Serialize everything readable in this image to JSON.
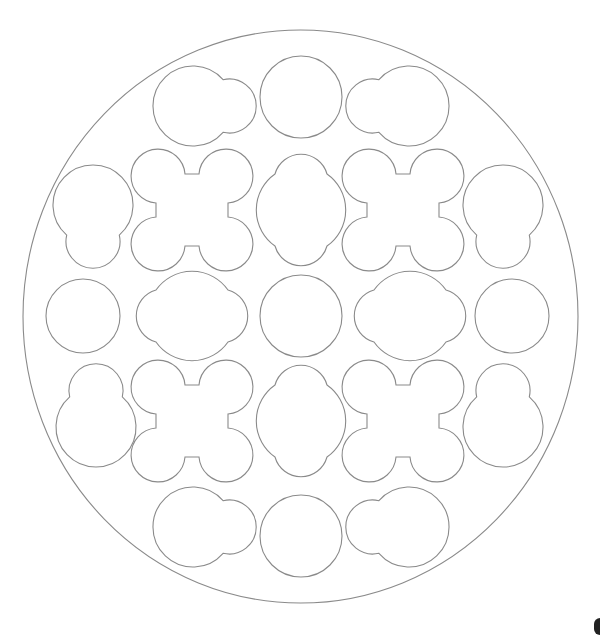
{
  "diagram": {
    "type": "geometric tiling pattern",
    "stroke_color": "#8a8a8a",
    "background": "#ffffff",
    "outer_boundary": {
      "shape": "circle",
      "cx": 300,
      "cy": 316,
      "rx": 277,
      "ry": 286
    },
    "grid": {
      "rows": 5,
      "cols": 5,
      "col_x": [
        83,
        192,
        301,
        410,
        519
      ],
      "row_y": [
        97,
        206,
        316,
        425,
        534
      ]
    },
    "shapes": [
      {
        "id": "r1c2",
        "kind": "circle-bump",
        "bump_dir": "right",
        "cx": 190,
        "cy": 106
      },
      {
        "id": "r1c3",
        "kind": "circle",
        "cx": 301,
        "cy": 97
      },
      {
        "id": "r1c4",
        "kind": "circle-bump",
        "bump_dir": "left",
        "cx": 412,
        "cy": 106
      },
      {
        "id": "r2c1",
        "kind": "circle-bump",
        "bump_dir": "down",
        "cx": 93,
        "cy": 203
      },
      {
        "id": "r2c2",
        "kind": "quatrefoil",
        "cx": 192,
        "cy": 206
      },
      {
        "id": "r2c3",
        "kind": "elongated-vertical",
        "cx": 301,
        "cy": 206
      },
      {
        "id": "r2c4",
        "kind": "quatrefoil",
        "cx": 410,
        "cy": 206
      },
      {
        "id": "r2c5",
        "kind": "circle-bump",
        "bump_dir": "down",
        "cx": 503,
        "cy": 203
      },
      {
        "id": "r3c1",
        "kind": "circle",
        "cx": 83,
        "cy": 316
      },
      {
        "id": "r3c2",
        "kind": "elongated-horizontal",
        "cx": 192,
        "cy": 316
      },
      {
        "id": "r3c3",
        "kind": "circle",
        "cx": 301,
        "cy": 316
      },
      {
        "id": "r3c4",
        "kind": "elongated-horizontal",
        "cx": 410,
        "cy": 316
      },
      {
        "id": "r3c5",
        "kind": "circle",
        "cx": 519,
        "cy": 316
      },
      {
        "id": "r4c1",
        "kind": "circle-bump",
        "bump_dir": "up",
        "cx": 96,
        "cy": 428
      },
      {
        "id": "r4c2",
        "kind": "quatrefoil",
        "cx": 192,
        "cy": 425
      },
      {
        "id": "r4c3",
        "kind": "elongated-vertical",
        "cx": 301,
        "cy": 425
      },
      {
        "id": "r4c4",
        "kind": "quatrefoil",
        "cx": 410,
        "cy": 425
      },
      {
        "id": "r4c5",
        "kind": "circle-bump",
        "bump_dir": "up",
        "cx": 503,
        "cy": 428
      },
      {
        "id": "r5c2",
        "kind": "circle-bump",
        "bump_dir": "right",
        "cx": 190,
        "cy": 527
      },
      {
        "id": "r5c3",
        "kind": "circle",
        "cx": 301,
        "cy": 534
      },
      {
        "id": "r5c4",
        "kind": "circle-bump",
        "bump_dir": "left",
        "cx": 410,
        "cy": 527
      }
    ]
  }
}
